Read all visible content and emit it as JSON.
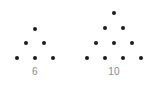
{
  "figure": {
    "background_color": "#ffffff",
    "dot_color": "#1c1c1c",
    "label_color": "#8a8a8a",
    "dot_diameter_px": 4
  },
  "chart_data": {
    "type": "scatter",
    "title": "",
    "subtitle": "",
    "xlabel": "",
    "ylabel": "",
    "grid": false,
    "legend": null,
    "xlim": [
      0,
      160
    ],
    "ylim": [
      88,
      0
    ],
    "groups": [
      {
        "name": "triangle-6",
        "label": "6",
        "label_x": 35,
        "label_y": 72,
        "rows": 3,
        "dot_count": 6,
        "row_counts": [
          1,
          2,
          3
        ],
        "points": [
          {
            "x": 35,
            "y": 29
          },
          {
            "x": 26,
            "y": 43
          },
          {
            "x": 44,
            "y": 43
          },
          {
            "x": 17,
            "y": 58
          },
          {
            "x": 35,
            "y": 58
          },
          {
            "x": 53,
            "y": 58
          }
        ]
      },
      {
        "name": "triangle-10",
        "label": "10",
        "label_x": 114,
        "label_y": 72,
        "rows": 4,
        "dot_count": 10,
        "row_counts": [
          1,
          2,
          3,
          4
        ],
        "points": [
          {
            "x": 114,
            "y": 13
          },
          {
            "x": 105,
            "y": 28
          },
          {
            "x": 123,
            "y": 28
          },
          {
            "x": 96,
            "y": 43
          },
          {
            "x": 114,
            "y": 43
          },
          {
            "x": 132,
            "y": 43
          },
          {
            "x": 87,
            "y": 58
          },
          {
            "x": 105,
            "y": 58
          },
          {
            "x": 123,
            "y": 58
          },
          {
            "x": 141,
            "y": 58
          }
        ]
      }
    ]
  },
  "labels": {
    "left": "6",
    "right": "10"
  }
}
